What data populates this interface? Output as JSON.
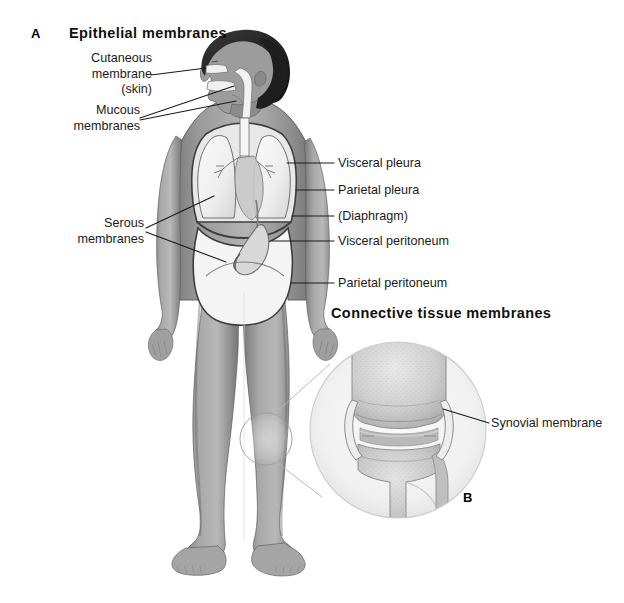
{
  "figure": {
    "width": 624,
    "height": 603,
    "background": "#ffffff",
    "ink": "#1a1a1a"
  },
  "panels": [
    {
      "letter": "A",
      "heading": "Epithelial membranes",
      "subject": "full-body anterior view showing epithelial membrane locations"
    },
    {
      "letter": "B",
      "heading": "Connective tissue membranes",
      "subject": "magnified knee joint showing synovial membrane"
    }
  ],
  "panel_a": {
    "letter": "A",
    "heading": "Epithelial membranes",
    "labels_left": [
      {
        "id": "cutaneous-membrane",
        "lines": [
          "Cutaneous",
          "membrane",
          "(skin)"
        ]
      },
      {
        "id": "mucous-membranes",
        "lines": [
          "Mucous",
          "membranes"
        ]
      },
      {
        "id": "serous-membranes",
        "lines": [
          "Serous",
          "membranes"
        ]
      }
    ],
    "labels_right": [
      {
        "id": "visceral-pleura",
        "text": "Visceral pleura"
      },
      {
        "id": "parietal-pleura",
        "text": "Parietal pleura"
      },
      {
        "id": "diaphragm",
        "text": "(Diaphragm)"
      },
      {
        "id": "visceral-peritoneum",
        "text": "Visceral peritoneum"
      },
      {
        "id": "parietal-peritoneum",
        "text": "Parietal peritoneum"
      }
    ]
  },
  "panel_b": {
    "letter": "B",
    "heading": "Connective tissue membranes",
    "labels_right": [
      {
        "id": "synovial-membrane",
        "text": "Synovial membrane"
      }
    ]
  },
  "colors": {
    "body_mid": "#8d8d8d",
    "body_light": "#bdbdbd",
    "body_shadow": "#6f6f6f",
    "hair_dark": "#2b2b2b",
    "organ_light": "#f2f2f2",
    "organ_mid": "#cfcfcf",
    "bone_light": "#dcdcdc",
    "bone_mid": "#b5b5b5",
    "leader_line": "#1a1a1a"
  }
}
